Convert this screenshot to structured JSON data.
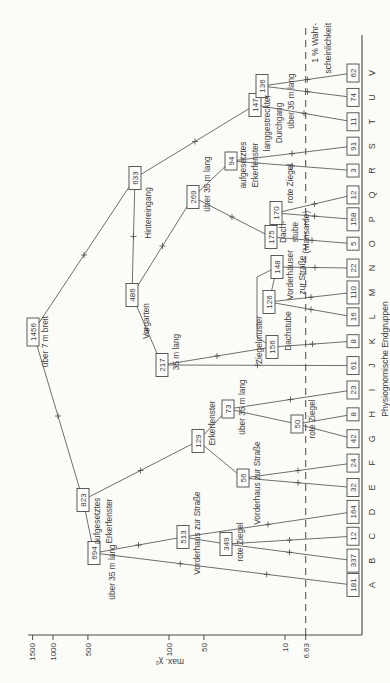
{
  "chart_data": {
    "type": "dendrogram",
    "title": "",
    "axis": {
      "label": "max. χ²",
      "scale": "log",
      "ticks": [
        1500,
        1000,
        500,
        100,
        50,
        10
      ],
      "significance_value": "6.63",
      "significance_label_lines": [
        "1 % Wahr-",
        "scheinlichkeit"
      ],
      "x_axis_label": "Physiognomische Endgruppen"
    },
    "leaves": [
      {
        "letter": "A",
        "count": 181
      },
      {
        "letter": "B",
        "count": 337
      },
      {
        "letter": "C",
        "count": 12
      },
      {
        "letter": "D",
        "count": 164
      },
      {
        "letter": "E",
        "count": 32
      },
      {
        "letter": "F",
        "count": 24
      },
      {
        "letter": "G",
        "count": 42
      },
      {
        "letter": "H",
        "count": 8
      },
      {
        "letter": "I",
        "count": 23
      },
      {
        "letter": "J",
        "count": 61
      },
      {
        "letter": "K",
        "count": 8
      },
      {
        "letter": "L",
        "count": 16
      },
      {
        "letter": "M",
        "count": 110
      },
      {
        "letter": "N",
        "count": 22
      },
      {
        "letter": "O",
        "count": 5
      },
      {
        "letter": "P",
        "count": 158
      },
      {
        "letter": "Q",
        "count": 12
      },
      {
        "letter": "R",
        "count": 3
      },
      {
        "letter": "S",
        "count": 91
      },
      {
        "letter": "T",
        "count": 11
      },
      {
        "letter": "U",
        "count": 74
      },
      {
        "letter": "V",
        "count": 62
      }
    ],
    "nodes": [
      {
        "id": "1456",
        "count": 1456,
        "attribute": "über 7 m breit",
        "children": [
          "823",
          "633"
        ],
        "x": 351,
        "y": 33,
        "label": {
          "lines": [
            "über 7 m breit"
          ],
          "x": 367,
          "y": 48,
          "anchor": "end"
        }
      },
      {
        "id": "823",
        "count": 823,
        "attribute": "aufgesetztes Erkerfenster",
        "children": [
          "694",
          "129"
        ],
        "x": 183,
        "y": 83,
        "label": {
          "lines": [
            "aufgesetztes",
            "Erkerfenster"
          ],
          "x": 162,
          "y": 100,
          "anchor": "middle"
        }
      },
      {
        "id": "694",
        "count": 694,
        "attribute": "über 35 m lang",
        "children": [
          "A",
          "513"
        ],
        "x": 130,
        "y": 94,
        "label": {
          "lines": [
            "über 35 m lang"
          ],
          "x": 111,
          "y": 115,
          "anchor": "middle"
        }
      },
      {
        "id": "513",
        "count": 513,
        "attribute": "Vorderhaus zur Straße",
        "children": [
          "349",
          "D"
        ],
        "x": 146,
        "y": 183,
        "label": {
          "lines": [
            "Vorderhaus zur Straße"
          ],
          "x": 150,
          "y": 200,
          "anchor": "middle"
        }
      },
      {
        "id": "349",
        "count": 349,
        "attribute": "rote Ziegel",
        "children": [
          "B",
          "C"
        ],
        "x": 139,
        "y": 226,
        "label": {
          "lines": [
            "rote Ziegel"
          ],
          "x": 141,
          "y": 243,
          "anchor": "middle"
        }
      },
      {
        "id": "129",
        "count": 129,
        "attribute": "Erkerfenster",
        "children": [
          "56",
          "73"
        ],
        "x": 242,
        "y": 198,
        "label": {
          "lines": [
            "Erkerfenster"
          ],
          "x": 260,
          "y": 215,
          "anchor": "middle"
        }
      },
      {
        "id": "56",
        "count": 56,
        "attribute": "Vorderhaus zur Straße",
        "children": [
          "E",
          "F"
        ],
        "x": 205,
        "y": 243,
        "label": {
          "lines": [
            "Vorderhaus zur Straße"
          ],
          "x": 200,
          "y": 260,
          "anchor": "middle"
        }
      },
      {
        "id": "73",
        "count": 73,
        "attribute": "über 35 m lang",
        "children": [
          "50",
          "I"
        ],
        "x": 274,
        "y": 228,
        "label": {
          "lines": [
            "über 35 m lang"
          ],
          "x": 276,
          "y": 245,
          "anchor": "middle"
        }
      },
      {
        "id": "50",
        "count": 50,
        "attribute": "rote Ziegel",
        "children": [
          "G",
          "H"
        ],
        "x": 259,
        "y": 297,
        "label": {
          "lines": [
            "rote Ziegel"
          ],
          "x": 264,
          "y": 315,
          "anchor": "middle"
        }
      },
      {
        "id": "633",
        "count": 633,
        "attribute": "Hintereingang",
        "children": [
          "486",
          "147"
        ],
        "x": 505,
        "y": 135,
        "label": {
          "lines": [
            "Hintereingang"
          ],
          "x": 470,
          "y": 151,
          "anchor": "middle"
        }
      },
      {
        "id": "486",
        "count": 486,
        "attribute": "Vorgarten",
        "children": [
          "217",
          "269"
        ],
        "x": 388,
        "y": 132,
        "label": {
          "lines": [
            "Vorgarten"
          ],
          "x": 362,
          "y": 149,
          "anchor": "middle"
        }
      },
      {
        "id": "217",
        "count": 217,
        "attribute": "35 m lang",
        "children": [
          "J",
          "156"
        ],
        "x": 318,
        "y": 162,
        "label": {
          "lines": [
            "35 m lang"
          ],
          "x": 331,
          "y": 179,
          "anchor": "middle"
        }
      },
      {
        "id": "156",
        "count": 156,
        "attribute": "Dachstube",
        "children": [
          "K",
          "148"
        ],
        "x": 336,
        "y": 272,
        "label": {
          "lines": [
            "Dachstube"
          ],
          "x": 352,
          "y": 291,
          "anchor": "middle"
        }
      },
      {
        "id": "148",
        "count": 148,
        "attribute": "Vorderhäuser zur Straße",
        "children": [
          "126",
          "N"
        ],
        "x": 416,
        "y": 277,
        "label": {
          "lines": [
            "Vorderhäuser",
            "zur Straße"
          ],
          "x": 408,
          "y": 293,
          "anchor": "middle"
        }
      },
      {
        "id": "126",
        "count": 126,
        "attribute": "Ziegelmuster",
        "children": [
          "L",
          "M"
        ],
        "x": 381,
        "y": 269,
        "label": {
          "lines": [
            "Ziegelmuster"
          ],
          "x": 367,
          "y": 262,
          "anchor": "end"
        }
      },
      {
        "id": "269",
        "count": 269,
        "attribute": "über 35 m lang",
        "children": [
          "94",
          "175"
        ],
        "x": 486,
        "y": 193,
        "label": {
          "lines": [
            "über 35 m lang"
          ],
          "x": 499,
          "y": 210,
          "anchor": "middle"
        }
      },
      {
        "id": "175",
        "count": 175,
        "attribute": "Dachstube (Mansarde)",
        "children": [
          "O",
          "170"
        ],
        "x": 446,
        "y": 271,
        "label": {
          "lines": [
            "Dach-",
            "stube",
            "(Mansarde)"
          ],
          "x": 451,
          "y": 286,
          "anchor": "middle"
        }
      },
      {
        "id": "170",
        "count": 170,
        "attribute": "rote Ziegel",
        "children": [
          "P",
          "Q"
        ],
        "x": 470,
        "y": 276,
        "label": {
          "lines": [
            "rote Ziegel"
          ],
          "x": 480,
          "y": 293,
          "anchor": "start"
        }
      },
      {
        "id": "94",
        "count": 94,
        "attribute": "aufgesetztes Erkerfenster",
        "children": [
          "R",
          "S"
        ],
        "x": 522,
        "y": 231,
        "label": {
          "lines": [
            "aufgesetztes",
            "Erkerfenster"
          ],
          "x": 518,
          "y": 246,
          "anchor": "middle"
        }
      },
      {
        "id": "147",
        "count": 147,
        "attribute": "langgestreckter Durchgang",
        "children": [
          "T",
          "136"
        ],
        "x": 578,
        "y": 255,
        "label": {
          "lines": [
            "langgestreckter",
            "Durchgang"
          ],
          "x": 560,
          "y": 270,
          "anchor": "middle"
        }
      },
      {
        "id": "136",
        "count": 136,
        "attribute": "über 35 m lang",
        "children": [
          "U",
          "V"
        ],
        "x": 597,
        "y": 262,
        "label": {
          "lines": [
            "über 35 m lang"
          ],
          "x": 582,
          "y": 294,
          "anchor": "middle"
        }
      }
    ],
    "connector_overrides": [
      {
        "from": "156",
        "to": "148",
        "via": [
          [
            346,
            257
          ],
          [
            406,
            257
          ]
        ]
      }
    ]
  },
  "layout": {
    "leaf_start_x": 98,
    "leaf_step_x": 24.38,
    "baseline_y": 362,
    "baseline_x2": 648,
    "leaf_box_center_y": 353,
    "letter_y": 375,
    "axis_x": 48,
    "axis_top_y": 28,
    "log_y0": 401,
    "px_per_decade": 116,
    "sig_line_x2": 655,
    "x_label_x": 324,
    "x_label_y": 388,
    "colors": {
      "ink": "#4a4a4a",
      "text": "#3d3d3d",
      "paper": "#fbfbf8",
      "box_fill": "#fdfdfb"
    }
  }
}
